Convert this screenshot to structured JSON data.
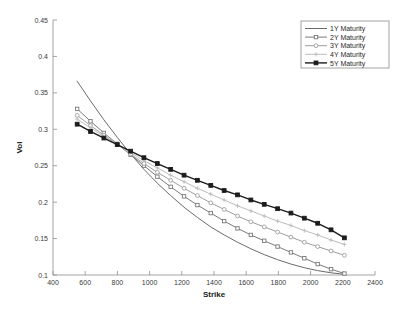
{
  "chart_data": {
    "type": "line",
    "title": "",
    "xlabel": "Strike",
    "ylabel": "Vol",
    "xlim": [
      400,
      2400
    ],
    "ylim": [
      0.1,
      0.45
    ],
    "xticks": [
      400,
      600,
      800,
      1000,
      1200,
      1400,
      1600,
      1800,
      2000,
      2200,
      2400
    ],
    "yticks": [
      0.1,
      0.15,
      0.2,
      0.25,
      0.3,
      0.35,
      0.4,
      0.45
    ],
    "xtick_labels": [
      "400",
      "600",
      "800",
      "1000",
      "1200",
      "1400",
      "1600",
      "1800",
      "2000",
      "2200",
      "2400"
    ],
    "ytick_labels": [
      "0.1",
      "0.15",
      "0.2",
      "0.25",
      "0.3",
      "0.35",
      "0.4",
      "0.45"
    ],
    "grid": false,
    "legend_position": "top-right",
    "x": [
      550,
      633,
      716,
      799,
      882,
      965,
      1048,
      1131,
      1214,
      1297,
      1380,
      1463,
      1546,
      1629,
      1712,
      1795,
      1878,
      1961,
      2044,
      2127,
      2210
    ],
    "series": [
      {
        "name": "1Y Maturity",
        "color": "#6b6b6b",
        "marker": "none",
        "linewidth": 1.0,
        "values": [
          0.366,
          0.339,
          0.313,
          0.289,
          0.266,
          0.245,
          0.226,
          0.209,
          0.193,
          0.179,
          0.166,
          0.155,
          0.145,
          0.136,
          0.128,
          0.121,
          0.115,
          0.11,
          0.106,
          0.103,
          0.101
        ]
      },
      {
        "name": "2Y Maturity",
        "color": "#7a7a7a",
        "marker": "square",
        "linewidth": 1.0,
        "values": [
          0.328,
          0.311,
          0.295,
          0.28,
          0.265,
          0.25,
          0.235,
          0.221,
          0.208,
          0.196,
          0.185,
          0.174,
          0.164,
          0.155,
          0.147,
          0.139,
          0.131,
          0.123,
          0.115,
          0.108,
          0.102
        ]
      },
      {
        "name": "3Y Maturity",
        "color": "#9e9e9e",
        "marker": "circle",
        "linewidth": 1.0,
        "values": [
          0.319,
          0.305,
          0.292,
          0.279,
          0.266,
          0.253,
          0.241,
          0.23,
          0.219,
          0.209,
          0.199,
          0.19,
          0.181,
          0.173,
          0.166,
          0.159,
          0.152,
          0.145,
          0.139,
          0.133,
          0.127
        ]
      },
      {
        "name": "4Y Maturity",
        "color": "#bdbdbd",
        "marker": "plus",
        "linewidth": 1.0,
        "values": [
          0.314,
          0.302,
          0.29,
          0.279,
          0.268,
          0.257,
          0.247,
          0.237,
          0.228,
          0.219,
          0.211,
          0.203,
          0.195,
          0.188,
          0.181,
          0.174,
          0.168,
          0.161,
          0.155,
          0.148,
          0.142
        ]
      },
      {
        "name": "5Y Maturity",
        "color": "#1c1c1c",
        "marker": "filled-square",
        "linewidth": 1.4,
        "values": [
          0.307,
          0.297,
          0.288,
          0.279,
          0.27,
          0.261,
          0.253,
          0.245,
          0.237,
          0.23,
          0.223,
          0.216,
          0.21,
          0.203,
          0.197,
          0.191,
          0.185,
          0.178,
          0.171,
          0.162,
          0.151
        ]
      }
    ]
  },
  "legend": {
    "entries": [
      {
        "label": "1Y Maturity"
      },
      {
        "label": "2Y Maturity"
      },
      {
        "label": "3Y Maturity"
      },
      {
        "label": "4Y Maturity"
      },
      {
        "label": "5Y Maturity"
      }
    ]
  },
  "axes": {
    "x_title": "Strike",
    "y_title": "Vol"
  }
}
